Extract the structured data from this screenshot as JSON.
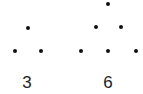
{
  "figures": [
    {
      "label": "3",
      "label_pos": [
        27,
        74
      ],
      "dots": [
        [
          28,
          28
        ],
        [
          15,
          51
        ],
        [
          41,
          51
        ]
      ]
    },
    {
      "label": "6",
      "label_pos": [
        108,
        74
      ],
      "dots": [
        [
          108,
          4
        ],
        [
          96,
          27
        ],
        [
          121,
          27
        ],
        [
          81,
          51
        ],
        [
          108,
          51
        ],
        [
          136,
          51
        ]
      ]
    }
  ],
  "colors": {
    "dot": "#111111",
    "text": "#222222",
    "background": "#ffffff"
  }
}
